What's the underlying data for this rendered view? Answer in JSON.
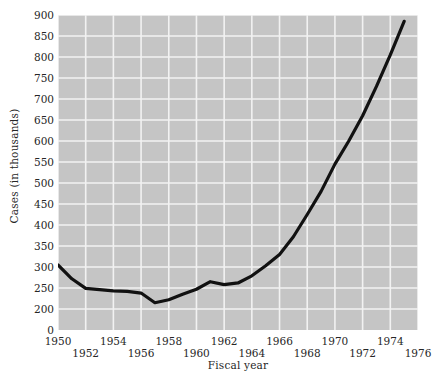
{
  "chart_data": {
    "type": "line",
    "title": "",
    "xlabel": "Fiscal year",
    "ylabel": "Cases (in thousands)",
    "xlim": [
      1950,
      1976
    ],
    "ylim": [
      200,
      900
    ],
    "y_axis_break": true,
    "y_zero_label": "0",
    "grid": true,
    "legend": "none",
    "line_color": "#111111",
    "plot_background": "#c5c5c5",
    "gridline_color": "#f2f2f2",
    "y_ticks": [
      900,
      850,
      800,
      750,
      700,
      650,
      600,
      550,
      500,
      450,
      400,
      350,
      300,
      250,
      200,
      0
    ],
    "y_tick_labels": [
      "900",
      "850",
      "800",
      "750",
      "700",
      "650",
      "600",
      "550",
      "500",
      "450",
      "400",
      "350",
      "300",
      "250",
      "200",
      "0"
    ],
    "x_ticks": [
      1950,
      1952,
      1954,
      1956,
      1958,
      1960,
      1962,
      1964,
      1966,
      1968,
      1970,
      1972,
      1974,
      1976
    ],
    "x_tick_labels": [
      "1950",
      "1952",
      "1954",
      "1956",
      "1958",
      "1960",
      "1962",
      "1964",
      "1966",
      "1968",
      "1970",
      "1972",
      "1974",
      "1976"
    ],
    "x": [
      1950,
      1951,
      1952,
      1953,
      1954,
      1955,
      1956,
      1957,
      1958,
      1959,
      1960,
      1961,
      1962,
      1963,
      1964,
      1965,
      1966,
      1967,
      1968,
      1969,
      1970,
      1971,
      1972,
      1973,
      1974,
      1975
    ],
    "values": [
      305,
      272,
      249,
      246,
      243,
      242,
      238,
      215,
      222,
      235,
      247,
      265,
      258,
      262,
      279,
      303,
      330,
      372,
      425,
      480,
      545,
      600,
      660,
      730,
      805,
      885
    ],
    "series": [
      {
        "name": "Cases",
        "values": [
          305,
          272,
          249,
          246,
          243,
          242,
          238,
          215,
          222,
          235,
          247,
          265,
          258,
          262,
          279,
          303,
          330,
          372,
          425,
          480,
          545,
          600,
          660,
          730,
          805,
          885
        ]
      }
    ]
  }
}
